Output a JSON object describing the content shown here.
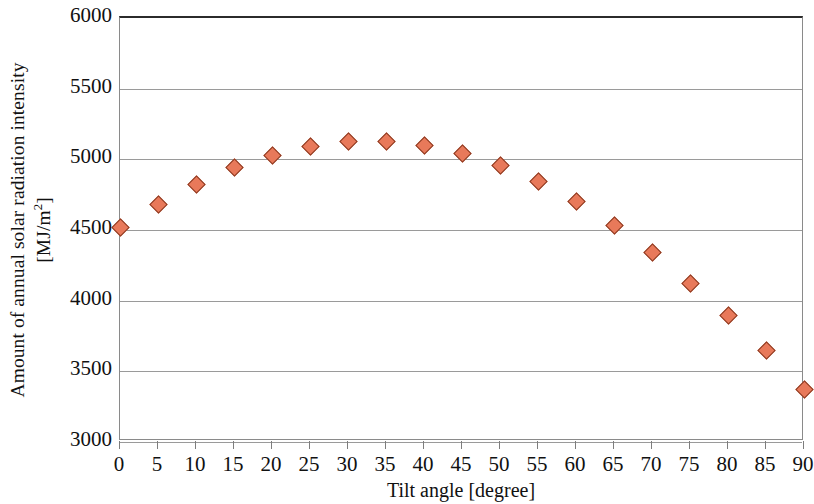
{
  "chart_data": {
    "type": "scatter",
    "title": "",
    "subtitle": "",
    "xlabel": "Tilt angle [degree]",
    "ylabel_line1": "Amount of annual solar radiation intensity",
    "ylabel_line2_prefix": "[MJ/m",
    "ylabel_line2_sup": "2",
    "ylabel_line2_suffix": "]",
    "ylabel_plain": "Amount of annual solar radiation intensity [MJ/m2]",
    "x": [
      0,
      5,
      10,
      15,
      20,
      25,
      30,
      35,
      40,
      45,
      50,
      55,
      60,
      65,
      70,
      75,
      80,
      85,
      90
    ],
    "values": [
      4520,
      4680,
      4820,
      4940,
      5030,
      5090,
      5125,
      5125,
      5095,
      5040,
      4955,
      4840,
      4705,
      4530,
      4340,
      4125,
      3895,
      3650,
      3370
    ],
    "xlim": [
      0,
      90
    ],
    "ylim": [
      3000,
      6000
    ],
    "x_ticks": [
      0,
      5,
      10,
      15,
      20,
      25,
      30,
      35,
      40,
      45,
      50,
      55,
      60,
      65,
      70,
      75,
      80,
      85,
      90
    ],
    "x_tick_labels": [
      "0",
      "5",
      "10",
      "15",
      "20",
      "25",
      "30",
      "35",
      "40",
      "45",
      "50",
      "55",
      "60",
      "65",
      "70",
      "75",
      "80",
      "85",
      "90"
    ],
    "y_ticks": [
      3000,
      3500,
      4000,
      4500,
      5000,
      5500,
      6000
    ],
    "y_tick_labels": [
      "3000",
      "3500",
      "4000",
      "4500",
      "5000",
      "5500",
      "6000"
    ],
    "grid": "horizontal",
    "legend": "none",
    "marker": "diamond",
    "marker_fill_color": "#E8795A",
    "marker_edge_color": "#8C3B23",
    "gridline_color": "#9A9A9A",
    "frame_color": "#8A8A8A",
    "background_color": "#FFFFFF"
  }
}
